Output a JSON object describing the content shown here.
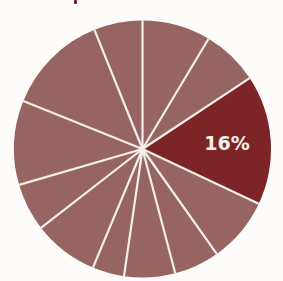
{
  "chart_data": {
    "type": "pie",
    "title": "",
    "start_angle_deg": 90,
    "direction": "clockwise",
    "highlight_index": 2,
    "slices": [
      {
        "value": 8.6,
        "label": ""
      },
      {
        "value": 7.1,
        "label": ""
      },
      {
        "value": 16.3,
        "label": "16%"
      },
      {
        "value": 8.2,
        "label": ""
      },
      {
        "value": 5.7,
        "label": ""
      },
      {
        "value": 6.4,
        "label": ""
      },
      {
        "value": 4.0,
        "label": ""
      },
      {
        "value": 8.2,
        "label": ""
      },
      {
        "value": 6.0,
        "label": ""
      },
      {
        "value": 10.6,
        "label": ""
      },
      {
        "value": 12.8,
        "label": ""
      },
      {
        "value": 6.1,
        "label": ""
      }
    ],
    "annotations": [
      "16%"
    ]
  },
  "colors": {
    "base": "#966562",
    "highlight": "#7d2426",
    "separator": "#f6efea",
    "label": "#f7f1ec"
  },
  "geometry": {
    "cx": 142.5,
    "cy": 149,
    "r": 128.5
  }
}
